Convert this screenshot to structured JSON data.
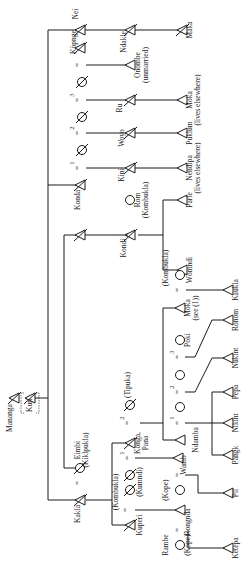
{
  "diagram": {
    "orientation": "rotated 90 degrees counter-clockwise",
    "colors": {
      "ink": "#1a1a1a",
      "paper": "#ffffff"
    },
    "symbols": {
      "male": "triangle",
      "female": "circle",
      "deceased": "struck-through",
      "marriage": "=",
      "unknown_sex": "slashed circle"
    },
    "people": {
      "mananga": "Mananga",
      "kuri": "Kuri",
      "kakla": "Kakla",
      "eimbi": "Eimbi",
      "eimbi_clan": "(Kiklpukla)",
      "kondi": "Kondi",
      "konda": "Konda",
      "nei": "Nei",
      "kopnge": "Köpnge",
      "ndakle": "Ndakle",
      "maka": "Maka",
      "onombe": "Onombe",
      "onombe_note": "(unmarried)",
      "ru": "Ru",
      "moka_ru": "Moka",
      "moka_ru_note": "(lives elsewhere)",
      "woyo": "Woyo",
      "puklum": "Puklum",
      "kini": "Kini",
      "nendipa": "Nendipa",
      "nendipa_note": "(lives elsewhere)",
      "rom": "Rom",
      "rom_clan": "(Kombukla)",
      "parle": "Parle",
      "womndi": "Wömndi",
      "kombukla_wife": "(Kombukla)",
      "kaukla": "Kaukla",
      "moka": "Moka",
      "moka_note": "(see (1))",
      "poki": "Pöki",
      "ronom": "Ronom",
      "nukint": "Nukint",
      "pepa": "Pepa",
      "nikint": "Nikint",
      "pangk": "Pangk",
      "ndamba": "Ndamba",
      "tipuka": "(Tipuka)",
      "konga_pana": "Konga,",
      "konga_pana2": "Pana",
      "kumndi": "(Kumndi)",
      "kombukla2": "(Kombukla)",
      "wamb": "Wamb",
      "kope1": "(Kope)",
      "pil": "Pil",
      "kuperi": "Kuperi",
      "rongnda": "Rongnda",
      "rambe": "Rambe",
      "kope2": "(Kope)",
      "ketepa": "Ketepa"
    },
    "marriage_numbers": [
      "1",
      "2",
      "3"
    ],
    "eq": "="
  }
}
